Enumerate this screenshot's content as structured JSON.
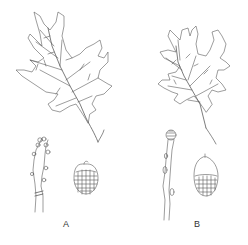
{
  "figure": {
    "type": "botanical comparison illustration",
    "specimens": [
      {
        "label": "A",
        "parts": [
          "leaf",
          "twig-with-buds",
          "acorn"
        ]
      },
      {
        "label": "B",
        "parts": [
          "leaf",
          "twig-with-buds",
          "acorn"
        ]
      }
    ],
    "colors": {
      "line": "#555555",
      "background": "#ffffff"
    }
  }
}
